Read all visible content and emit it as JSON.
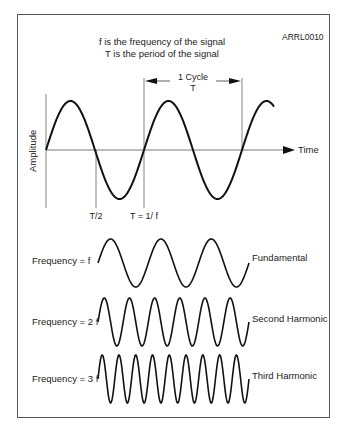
{
  "figure_id": "ARRL0010",
  "header": {
    "line1": "f is the frequency of the signal",
    "line2": "T is the period of the signal"
  },
  "axes": {
    "y_label": "Amplitude",
    "x_label": "Time"
  },
  "cycle_marker": {
    "line1": "1 Cycle",
    "line2": "T"
  },
  "tick_labels": {
    "half_period": "T/2",
    "period": "T = 1/ f"
  },
  "harmonics": [
    {
      "left_label": "Frequency = f",
      "right_label": "Fundamental",
      "cycles": 3
    },
    {
      "left_label": "Frequency = 2 f",
      "right_label": "Second Harmonic",
      "cycles": 6
    },
    {
      "left_label": "Frequency = 3 f",
      "right_label": "Third Harmonic",
      "cycles": 9
    }
  ],
  "colors": {
    "stroke": "#111111",
    "axis": "#555555",
    "text": "#222222"
  }
}
